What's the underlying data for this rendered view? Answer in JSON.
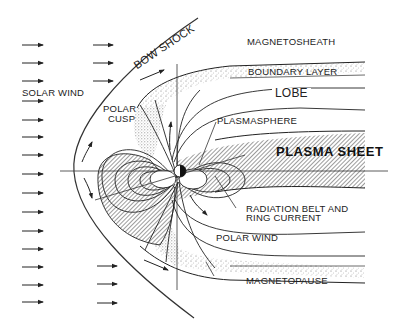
{
  "diagram": {
    "type": "magnetosphere-cross-section",
    "labels": {
      "bow_shock": "BOW SHOCK",
      "magnetosheath": "MAGNETOSHEATH",
      "solar_wind": "SOLAR WIND",
      "boundary_layer": "BOUNDARY LAYER",
      "lobe": "LOBE",
      "polar_cusp_line1": "POLAR",
      "polar_cusp_line2": "CUSP",
      "plasmasphere": "PLASMASPHERE",
      "plasma_sheet": "PLASMA SHEET",
      "radiation_belt_line1": "RADIATION BELT AND",
      "radiation_belt_line2": "RING CURRENT",
      "polar_wind": "POLAR WIND",
      "magnetopause": "MAGNETOPAUSE"
    },
    "colors": {
      "ink": "#1a1a1a",
      "hatch": "#555555",
      "stipple": "#777777",
      "background": "#ffffff"
    },
    "solar_wind_arrows": {
      "left_column_count": 14,
      "middle_column_count_top": 3,
      "middle_column_count_bottom": 3
    }
  }
}
